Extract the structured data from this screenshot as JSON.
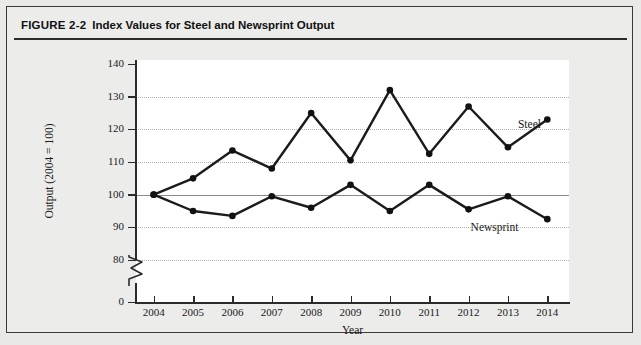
{
  "figure": {
    "label": "FIGURE 2-2",
    "title": "Index Values for Steel and Newsprint Output"
  },
  "chart_data": {
    "type": "line",
    "title": "Index Values for Steel and Newsprint Output",
    "xlabel": "Year",
    "ylabel": "Output (2004 = 100)",
    "categories": [
      "2004",
      "2005",
      "2006",
      "2007",
      "2008",
      "2009",
      "2010",
      "2011",
      "2012",
      "2013",
      "2014"
    ],
    "ylim": [
      80,
      140
    ],
    "yticks": [
      "0",
      "80",
      "90",
      "100",
      "110",
      "120",
      "130",
      "140"
    ],
    "axis_break": true,
    "grid": "horizontal-dotted",
    "legend": "inline-labels",
    "reference_line": 100,
    "series": [
      {
        "name": "Steel",
        "label_text": "Steel",
        "values": [
          100,
          105,
          113.5,
          108,
          125,
          110.5,
          132,
          112.5,
          127,
          114.5,
          123
        ]
      },
      {
        "name": "Newsprint",
        "label_text": "Newsprint",
        "values": [
          100,
          95,
          93.5,
          99.5,
          96,
          103,
          95,
          103,
          95.5,
          99.5,
          92.5
        ]
      }
    ]
  },
  "colors": {
    "line": "#1b1b1b",
    "grid": "#b9aeb6",
    "axis": "#2b2b2b",
    "plot_background": "#ffffff",
    "figure_background": "#ececeb"
  }
}
